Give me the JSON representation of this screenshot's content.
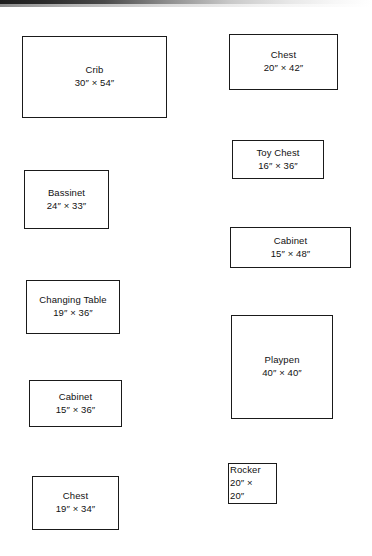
{
  "document": {
    "title": "Nursery Furniture Template Sheet",
    "background_color": "#ffffff",
    "line_color": "#1a1a1a",
    "has_scan_edge_artifact": true
  },
  "items": [
    {
      "name": "Crib",
      "dims": "30″ × 54″",
      "width_in": 30,
      "length_in": 54,
      "x": 22,
      "y": 36,
      "w": 145,
      "h": 82
    },
    {
      "name": "Chest",
      "dims": "20″ × 42″",
      "width_in": 20,
      "length_in": 42,
      "x": 229,
      "y": 34,
      "w": 109,
      "h": 56
    },
    {
      "name": "Toy Chest",
      "dims": "16″ × 36″",
      "width_in": 16,
      "length_in": 36,
      "x": 232,
      "y": 140,
      "w": 92,
      "h": 39
    },
    {
      "name": "Bassinet",
      "dims": "24″ × 33″",
      "width_in": 24,
      "length_in": 33,
      "x": 24,
      "y": 170,
      "w": 85,
      "h": 59
    },
    {
      "name": "Cabinet",
      "dims": "15″ × 48″",
      "width_in": 15,
      "length_in": 48,
      "x": 230,
      "y": 227,
      "w": 121,
      "h": 41
    },
    {
      "name": "Changing Table",
      "dims": "19″ × 36″",
      "width_in": 19,
      "length_in": 36,
      "x": 26,
      "y": 280,
      "w": 94,
      "h": 54
    },
    {
      "name": "Playpen",
      "dims": "40″ × 40″",
      "width_in": 40,
      "length_in": 40,
      "x": 231,
      "y": 315,
      "w": 102,
      "h": 104
    },
    {
      "name": "Cabinet",
      "dims": "15″ × 36″",
      "width_in": 15,
      "length_in": 36,
      "x": 29,
      "y": 380,
      "w": 93,
      "h": 47
    },
    {
      "name": "Rocker",
      "dims_line1": "20″ ×",
      "dims_line2": "20″",
      "width_in": 20,
      "length_in": 20,
      "x": 228,
      "y": 463,
      "w": 49,
      "h": 41,
      "text_overflows": true
    },
    {
      "name": "Chest",
      "dims": "19″ × 34″",
      "width_in": 19,
      "length_in": 34,
      "x": 32,
      "y": 476,
      "w": 87,
      "h": 54
    }
  ]
}
